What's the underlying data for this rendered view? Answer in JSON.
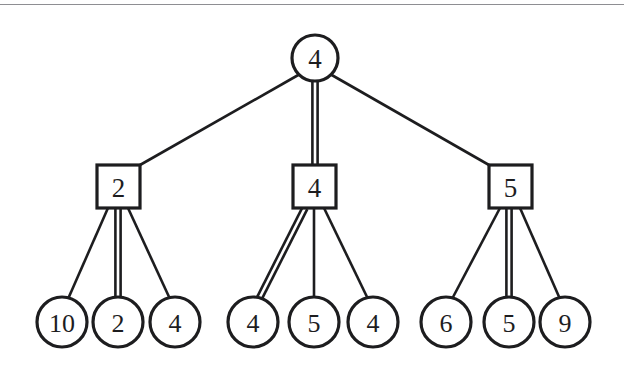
{
  "figure": {
    "kind": "tree-diagram",
    "colors": {
      "ink": "#1d1d1f",
      "background": "#ffffff",
      "rule": "#8e8e92"
    },
    "top_rule": true
  },
  "chart_data": {
    "type": "diagram",
    "title": "",
    "root": {
      "id": "root",
      "shape": "circle",
      "label": "4",
      "cx": 315,
      "cy": 58,
      "r": 23
    },
    "internal_nodes": [
      {
        "id": "n-left",
        "shape": "square",
        "label": "2",
        "x": 97,
        "y": 165,
        "w": 43,
        "h": 43
      },
      {
        "id": "n-middle",
        "shape": "square",
        "label": "4",
        "x": 293,
        "y": 165,
        "w": 43,
        "h": 43
      },
      {
        "id": "n-right",
        "shape": "square",
        "label": "5",
        "x": 489,
        "y": 165,
        "w": 43,
        "h": 43
      }
    ],
    "leaves": [
      {
        "id": "leaf-1",
        "shape": "circle",
        "label": "10",
        "cx": 62,
        "cy": 322,
        "r": 25,
        "parent": "n-left"
      },
      {
        "id": "leaf-2",
        "shape": "circle",
        "label": "2",
        "cx": 118,
        "cy": 322,
        "r": 25,
        "parent": "n-left"
      },
      {
        "id": "leaf-3",
        "shape": "circle",
        "label": "4",
        "cx": 175,
        "cy": 322,
        "r": 25,
        "parent": "n-left"
      },
      {
        "id": "leaf-4",
        "shape": "circle",
        "label": "4",
        "cx": 253,
        "cy": 322,
        "r": 25,
        "parent": "n-middle"
      },
      {
        "id": "leaf-5",
        "shape": "circle",
        "label": "5",
        "cx": 314,
        "cy": 322,
        "r": 25,
        "parent": "n-middle"
      },
      {
        "id": "leaf-6",
        "shape": "circle",
        "label": "4",
        "cx": 373,
        "cy": 322,
        "r": 25,
        "parent": "n-middle"
      },
      {
        "id": "leaf-7",
        "shape": "circle",
        "label": "6",
        "cx": 446,
        "cy": 322,
        "r": 25,
        "parent": "n-right"
      },
      {
        "id": "leaf-8",
        "shape": "circle",
        "label": "5",
        "cx": 509,
        "cy": 322,
        "r": 25,
        "parent": "n-right"
      },
      {
        "id": "leaf-9",
        "shape": "circle",
        "label": "9",
        "cx": 565,
        "cy": 322,
        "r": 25,
        "parent": "n-right"
      }
    ],
    "edges": [
      {
        "id": "e-root-left",
        "from": "root",
        "to": "n-left",
        "x1": 300,
        "y1": 74,
        "x2": 140,
        "y2": 165,
        "double": false
      },
      {
        "id": "e-root-middle",
        "from": "root",
        "to": "n-middle",
        "x1": 315,
        "y1": 81,
        "x2": 315,
        "y2": 165,
        "double": true
      },
      {
        "id": "e-root-right",
        "from": "root",
        "to": "n-right",
        "x1": 330,
        "y1": 74,
        "x2": 489,
        "y2": 165,
        "double": false
      },
      {
        "id": "e-left-1",
        "from": "n-left",
        "to": "leaf-1",
        "x1": 108,
        "y1": 208,
        "x2": 68,
        "y2": 299,
        "double": false
      },
      {
        "id": "e-left-2",
        "from": "n-left",
        "to": "leaf-2",
        "x1": 118,
        "y1": 208,
        "x2": 118,
        "y2": 297,
        "double": true
      },
      {
        "id": "e-left-3",
        "from": "n-left",
        "to": "leaf-3",
        "x1": 128,
        "y1": 208,
        "x2": 170,
        "y2": 299,
        "double": false
      },
      {
        "id": "e-mid-1",
        "from": "n-middle",
        "to": "leaf-4",
        "x1": 305,
        "y1": 208,
        "x2": 259,
        "y2": 299,
        "double": true
      },
      {
        "id": "e-mid-2",
        "from": "n-middle",
        "to": "leaf-5",
        "x1": 314,
        "y1": 208,
        "x2": 314,
        "y2": 297,
        "double": false
      },
      {
        "id": "e-mid-3",
        "from": "n-middle",
        "to": "leaf-6",
        "x1": 324,
        "y1": 208,
        "x2": 368,
        "y2": 299,
        "double": false
      },
      {
        "id": "e-right-1",
        "from": "n-right",
        "to": "leaf-7",
        "x1": 500,
        "y1": 208,
        "x2": 452,
        "y2": 299,
        "double": false
      },
      {
        "id": "e-right-2",
        "from": "n-right",
        "to": "leaf-8",
        "x1": 509,
        "y1": 208,
        "x2": 509,
        "y2": 297,
        "double": true
      },
      {
        "id": "e-right-3",
        "from": "n-right",
        "to": "leaf-9",
        "x1": 520,
        "y1": 208,
        "x2": 560,
        "y2": 299,
        "double": false
      }
    ]
  }
}
